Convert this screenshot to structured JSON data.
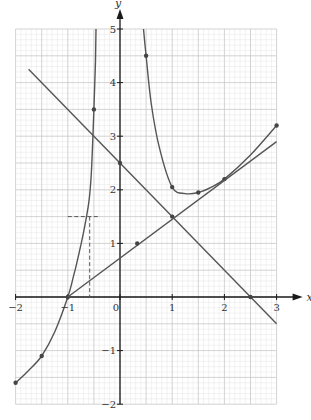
{
  "chart_data": {
    "type": "line",
    "title": "",
    "xlabel": "x",
    "ylabel": "y",
    "xlim": [
      -2,
      3
    ],
    "ylim": [
      -2,
      5
    ],
    "grid": true,
    "grid_minor_step": 0.1,
    "grid_major_step": 0.5,
    "x_ticks": [
      -2,
      -1,
      0,
      1,
      2,
      3
    ],
    "x_tick_labels": [
      "−2",
      "−1",
      "0",
      "1",
      "2",
      "3"
    ],
    "y_ticks": [
      -2,
      -1,
      1,
      2,
      3,
      4,
      5
    ],
    "y_tick_labels": [
      "−2",
      "−1",
      "1",
      "2",
      "3",
      "4",
      "5"
    ],
    "origin_label": "0",
    "series": [
      {
        "name": "left-curve",
        "style": "solid",
        "points": [
          [
            -2,
            -1.6
          ],
          [
            -1.75,
            -1.37
          ],
          [
            -1.5,
            -1.1
          ],
          [
            -1.25,
            -0.65
          ],
          [
            -1,
            0
          ],
          [
            -0.9,
            0.35
          ],
          [
            -0.8,
            0.75
          ],
          [
            -0.7,
            1.2
          ],
          [
            -0.6,
            1.75
          ],
          [
            -0.55,
            2.3
          ],
          [
            -0.5,
            3.5
          ],
          [
            -0.47,
            4.4
          ],
          [
            -0.46,
            5
          ]
        ],
        "markers": [
          [
            -2,
            -1.6
          ],
          [
            -1.5,
            -1.1
          ],
          [
            -1,
            0
          ],
          [
            -0.5,
            3.5
          ]
        ]
      },
      {
        "name": "right-curve",
        "style": "solid",
        "points": [
          [
            0.45,
            5
          ],
          [
            0.5,
            4.5
          ],
          [
            0.6,
            3.6
          ],
          [
            0.75,
            2.8
          ],
          [
            1,
            2.05
          ],
          [
            1.25,
            1.93
          ],
          [
            1.5,
            1.95
          ],
          [
            1.75,
            2.05
          ],
          [
            2,
            2.2
          ],
          [
            2.5,
            2.65
          ],
          [
            3,
            3.2
          ]
        ],
        "markers": [
          [
            0.5,
            4.5
          ],
          [
            1,
            2.05
          ],
          [
            1.5,
            1.95
          ],
          [
            2,
            2.2
          ],
          [
            3,
            3.2
          ]
        ]
      },
      {
        "name": "decreasing-line",
        "style": "solid",
        "equation": "y = 2.5 - x",
        "points": [
          [
            -1.75,
            4.25
          ],
          [
            3,
            -0.5
          ]
        ],
        "markers": [
          [
            0,
            2.5
          ],
          [
            1,
            1.5
          ],
          [
            2.5,
            0
          ]
        ]
      },
      {
        "name": "increasing-line",
        "style": "solid",
        "equation": "y = 0.75x + 0.75",
        "points": [
          [
            -1,
            0
          ],
          [
            3,
            2.9
          ]
        ],
        "markers": [
          [
            0.33,
            1
          ]
        ]
      },
      {
        "name": "dashed-horizontal",
        "style": "dashed",
        "points": [
          [
            -1,
            1.5
          ],
          [
            -0.38,
            1.5
          ]
        ],
        "markers": []
      },
      {
        "name": "dashed-vertical",
        "style": "dashed",
        "points": [
          [
            -0.58,
            1.5
          ],
          [
            -0.58,
            0
          ]
        ],
        "markers": []
      }
    ]
  },
  "colors": {
    "curve": "#555555",
    "axis": "#1a1a1a",
    "grid_minor": "#e4e4e4",
    "grid_major": "#c8c8c8",
    "marker": "#444444",
    "background": "#ffffff"
  },
  "layout": {
    "x0_px": 120,
    "y0_px": 297,
    "x_unit_px": 52.2,
    "y_unit_px": 53.6
  }
}
